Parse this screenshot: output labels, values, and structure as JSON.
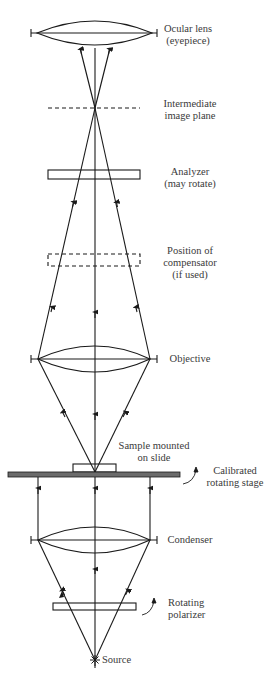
{
  "labels": {
    "ocular": [
      "Ocular lens",
      "(eyepiece)"
    ],
    "intermediate": [
      "Intermediate",
      "image plane"
    ],
    "analyzer": [
      "Analyzer",
      "(may rotate)"
    ],
    "compensator": [
      "Position of",
      "compensator",
      "(if used)"
    ],
    "objective": [
      "Objective"
    ],
    "sample": [
      "Sample mounted",
      "on slide"
    ],
    "stage": [
      "Calibrated",
      "rotating stage"
    ],
    "condenser": [
      "Condenser"
    ],
    "polarizer": [
      "Rotating",
      "polarizer"
    ],
    "source": [
      "Source"
    ]
  },
  "colors": {
    "line": "#1a1a1a",
    "stage_fill": "#6b6b6b",
    "text": "#3a3a3a"
  }
}
